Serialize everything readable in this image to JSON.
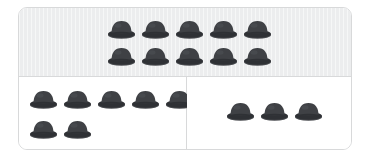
{
  "figure": {
    "type": "pictograph-grouping",
    "icon_name": "bowler-hat-icon",
    "total_count": 20,
    "panel_counts": [
      10,
      7,
      3
    ]
  },
  "colors": {
    "canvas": "#ffffff",
    "frame_border": "#d8d9da",
    "top_panel_fill": "#ecedee",
    "bottom_panel_fill": "#ffffff",
    "divider": "#d8d9da",
    "hat_crown": "#3f4145",
    "hat_band": "#2f3135",
    "hat_brim": "#4b4d51",
    "hat_highlight": "#55575c"
  },
  "panels": [
    {
      "id": "panel-top",
      "name": "top-panel",
      "fill": "shaded",
      "count": 10,
      "rows": [
        {
          "count": 5
        },
        {
          "count": 5
        }
      ]
    },
    {
      "id": "panel-bottom-left",
      "name": "bottom-left-panel",
      "fill": "white",
      "count": 7,
      "rows": [
        {
          "count": 5
        },
        {
          "count": 2
        }
      ]
    },
    {
      "id": "panel-bottom-right",
      "name": "bottom-right-panel",
      "fill": "white",
      "count": 3,
      "rows": [
        {
          "count": 3
        }
      ]
    }
  ]
}
